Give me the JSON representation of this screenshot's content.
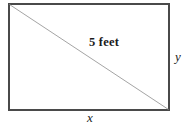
{
  "figure": {
    "type": "right-triangle-in-rectangle-diagram",
    "colors": {
      "background": "#ffffff",
      "rectangle_stroke": "#4a4a4a",
      "diagonal_stroke": "#9a9a9a",
      "text": "#1b1b1b"
    },
    "rectangle": {
      "name": "rectangle-outline",
      "x": 9,
      "y": 4,
      "width": 160,
      "height": 106,
      "stroke_width": 1.6
    },
    "diagonal": {
      "name": "diagonal-line",
      "x1": 9,
      "y1": 4,
      "x2": 169,
      "y2": 110,
      "stroke_width": 0.9
    },
    "labels": {
      "hypotenuse": "5 feet",
      "side_vertical": "y",
      "side_horizontal": "x"
    }
  }
}
